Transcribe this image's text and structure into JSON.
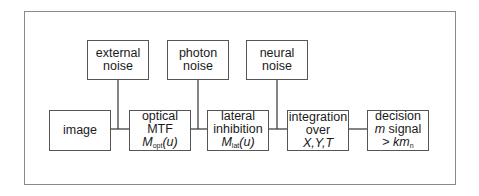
{
  "diagram": {
    "noise_sources": [
      {
        "id": "external",
        "lines": [
          "external",
          "noise"
        ]
      },
      {
        "id": "photon",
        "lines": [
          "photon",
          "noise"
        ]
      },
      {
        "id": "neural",
        "lines": [
          "neural",
          "noise"
        ]
      }
    ],
    "stages": [
      {
        "id": "image",
        "lines": [
          "image"
        ]
      },
      {
        "id": "optical",
        "line1": "optical",
        "line2": "MTF",
        "symbol": "M",
        "subscript": "opt",
        "arg": "(u)"
      },
      {
        "id": "lateral",
        "line1": "lateral",
        "line2": "inhibition",
        "symbol": "M",
        "subscript": "lat",
        "arg": "(u)"
      },
      {
        "id": "integration",
        "line1": "integration",
        "line2": "over",
        "line3": "X,Y,T"
      },
      {
        "id": "decision",
        "line1": "decision",
        "line2_italic": "m",
        "line2_rest": " signal",
        "line3_prefix": "> ",
        "line3_italic": "km",
        "line3_sub": "n"
      }
    ],
    "connections": [
      "image -> optical",
      "external noise -> (image->optical)",
      "optical -> lateral",
      "photon noise -> (optical->lateral)",
      "lateral -> integration",
      "neural noise -> (lateral->integration)",
      "integration -> decision"
    ]
  }
}
